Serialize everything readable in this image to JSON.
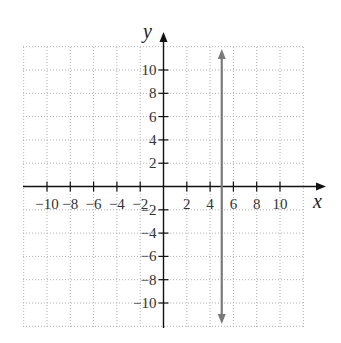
{
  "chart_data": {
    "type": "line",
    "title": "",
    "xlabel": "x",
    "ylabel": "y",
    "xlim": [
      -12,
      12
    ],
    "ylim": [
      -12,
      12
    ],
    "grid": true,
    "grid_style": "dotted",
    "x_ticks": [
      -10,
      -8,
      -6,
      -4,
      -2,
      2,
      4,
      6,
      8,
      10
    ],
    "y_ticks": [
      -10,
      -8,
      -6,
      -4,
      -2,
      2,
      4,
      6,
      8,
      10
    ],
    "x_tick_labels": [
      "−10",
      "−8",
      "−6",
      "−4",
      "−2",
      "2",
      "4",
      "6",
      "8",
      "10"
    ],
    "y_tick_labels": [
      "−10",
      "−8",
      "−6",
      "−4",
      "−2",
      "2",
      "4",
      "6",
      "8",
      "10"
    ],
    "series": [
      {
        "name": "x = 5",
        "kind": "vertical-line",
        "x": [
          5,
          5
        ],
        "y": [
          -11.8,
          11.8
        ],
        "arrows": "both",
        "color": "#7a7a7a"
      }
    ],
    "legend": null
  },
  "colors": {
    "axis": "#111111",
    "grid": "#b0b0b0",
    "line": "#7a7a7a"
  }
}
